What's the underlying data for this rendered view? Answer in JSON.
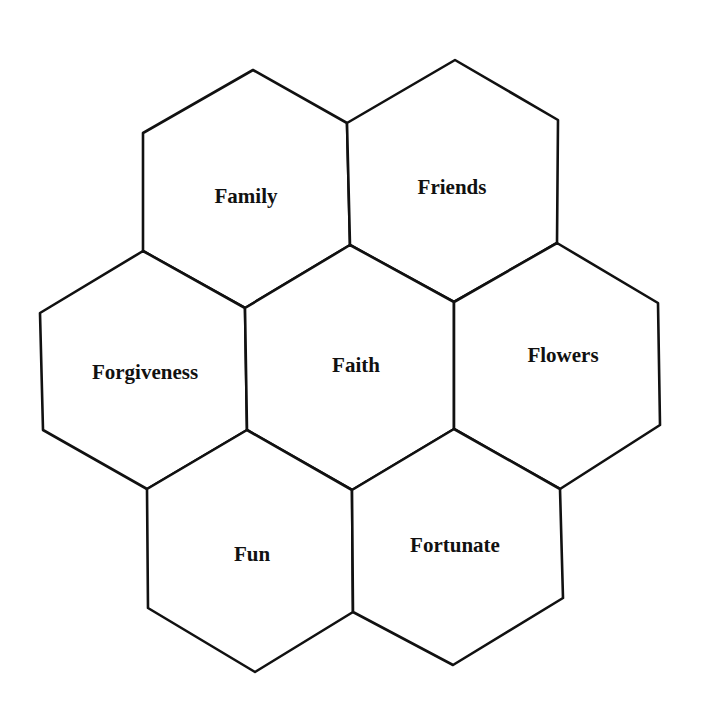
{
  "diagram": {
    "type": "hexagon-cluster",
    "center": {
      "label": "Faith"
    },
    "cells": [
      {
        "id": "family",
        "label": "Family",
        "position": "top-left"
      },
      {
        "id": "friends",
        "label": "Friends",
        "position": "top-right"
      },
      {
        "id": "forgiveness",
        "label": "Forgiveness",
        "position": "middle-left"
      },
      {
        "id": "faith",
        "label": "Faith",
        "position": "center"
      },
      {
        "id": "flowers",
        "label": "Flowers",
        "position": "middle-right"
      },
      {
        "id": "fun",
        "label": "Fun",
        "position": "bottom-left"
      },
      {
        "id": "fortunate",
        "label": "Fortunate",
        "position": "bottom-right"
      }
    ],
    "colors": {
      "stroke": "#111111",
      "fill": "#ffffff",
      "text": "#111111"
    }
  }
}
